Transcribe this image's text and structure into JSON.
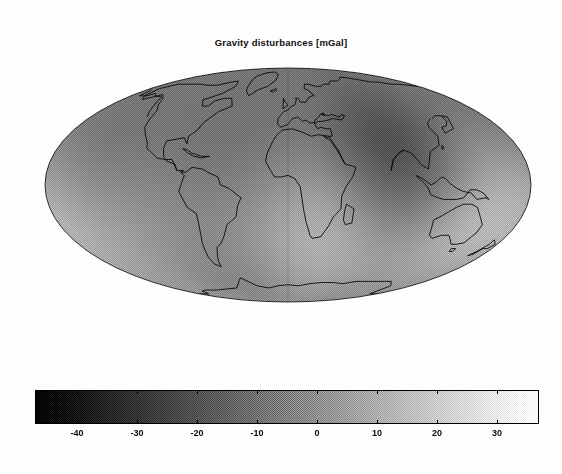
{
  "figure": {
    "background_color": "#fdfdfd",
    "width": 562,
    "height": 474
  },
  "title": {
    "text": "Gravity disturbances [mGal]",
    "color": "#111111"
  },
  "chart_data": {
    "type": "heatmap",
    "title": "Gravity disturbances [mGal]",
    "subtitle": "",
    "xlabel": "",
    "ylabel": "",
    "projection": "mollweide",
    "central_meridian": 0,
    "quantity": "Gravity disturbance",
    "units": "mGal",
    "grid": false,
    "legend_position": "bottom",
    "colormap": "gray",
    "colorbar": {
      "orientation": "horizontal",
      "vmin": -47,
      "vmax": 37,
      "ticks": [
        -40,
        -30,
        -20,
        -10,
        0,
        10,
        20,
        30
      ],
      "tick_labels": [
        "-40",
        "-30",
        "-20",
        "-10",
        "0",
        "10",
        "20",
        "30"
      ],
      "low_color": "#000000",
      "high_color": "#ffffff"
    },
    "features": [
      {
        "name": "Indian Ocean geoid low",
        "lon": 78,
        "lat": -5,
        "value": -47
      },
      {
        "name": "North Atlantic low",
        "lon": -38,
        "lat": 30,
        "value": -28
      },
      {
        "name": "Hudson Bay low",
        "lon": -85,
        "lat": 58,
        "value": -30
      },
      {
        "name": "Antarctic low",
        "lon": 125,
        "lat": -62,
        "value": -30
      },
      {
        "name": "Andes high",
        "lon": -70,
        "lat": -18,
        "value": 32
      },
      {
        "name": "New Guinea high",
        "lon": 142,
        "lat": -6,
        "value": 37
      },
      {
        "name": "North Atlantic ridge high",
        "lon": -30,
        "lat": 52,
        "value": 26
      },
      {
        "name": "Iceland high",
        "lon": -18,
        "lat": 64,
        "value": 22
      },
      {
        "name": "Himalaya high",
        "lon": 84,
        "lat": 32,
        "value": 24
      },
      {
        "name": "Philippine high",
        "lon": 128,
        "lat": 12,
        "value": 28
      },
      {
        "name": "Peru-Chile trench",
        "lon": -78,
        "lat": -22,
        "value": -18
      },
      {
        "name": "Central Pacific low",
        "lon": -155,
        "lat": -10,
        "value": -14
      },
      {
        "name": "West Africa low",
        "lon": 5,
        "lat": 8,
        "value": -12
      },
      {
        "name": "Caribbean high",
        "lon": -66,
        "lat": 14,
        "value": 18
      },
      {
        "name": "Sri Lanka low",
        "lon": 80,
        "lat": 2,
        "value": -42
      }
    ],
    "coastlines_drawn": true
  },
  "colorbar_ticks": [
    {
      "value": -40,
      "label": "-40"
    },
    {
      "value": -30,
      "label": "-30"
    },
    {
      "value": -20,
      "label": "-20"
    },
    {
      "value": -10,
      "label": "-10"
    },
    {
      "value": 0,
      "label": "0"
    },
    {
      "value": 10,
      "label": "10"
    },
    {
      "value": 20,
      "label": "20"
    },
    {
      "value": 30,
      "label": "30"
    }
  ]
}
